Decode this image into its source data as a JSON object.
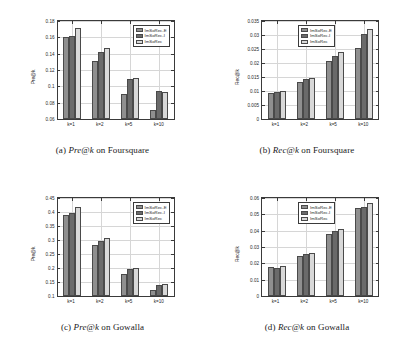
{
  "legend": {
    "position": "top-right",
    "entries": [
      "ImSoRec-E",
      "ImSoRec-I",
      "ImSoRec"
    ]
  },
  "colors": {
    "series_e": "#8f8f8f",
    "series_i": "#6a6a6a",
    "series_full": "#d8d8d8",
    "axis": "#3a3a3a",
    "grid": "#d6d6d6"
  },
  "chart_data": [
    {
      "id": "a",
      "type": "bar",
      "title": "(a) Pre@k on Foursquare",
      "caption_prefix": "(a)",
      "caption_metric": "Pre@k",
      "caption_suffix": "on Foursquare",
      "xlabel": "",
      "ylabel": "Pre@k",
      "categories": [
        "k=1",
        "k=2",
        "k=5",
        "k=10"
      ],
      "ylim": [
        0.06,
        0.18
      ],
      "yticks": [
        0.06,
        0.08,
        0.1,
        0.12,
        0.14,
        0.16,
        0.18
      ],
      "ytick_labels": [
        "0.06",
        "0.08",
        "0.1",
        "0.12",
        "0.14",
        "0.16",
        "0.18"
      ],
      "grid": true,
      "series": [
        {
          "name": "ImSoRec-E",
          "values": [
            0.1602,
            0.131,
            0.091,
            0.071
          ]
        },
        {
          "name": "ImSoRec-I",
          "values": [
            0.162,
            0.142,
            0.1088,
            0.0938
          ]
        },
        {
          "name": "ImSoRec",
          "values": [
            0.1718,
            0.1472,
            0.1102,
            0.0928
          ]
        }
      ]
    },
    {
      "id": "b",
      "type": "bar",
      "title": "(b) Rec@k on Foursquare",
      "caption_prefix": "(b)",
      "caption_metric": "Rec@k",
      "caption_suffix": "on Foursquare",
      "xlabel": "",
      "ylabel": "Rec@k",
      "categories": [
        "k=1",
        "k=2",
        "k=5",
        "k=10"
      ],
      "ylim": [
        0,
        0.035
      ],
      "yticks": [
        0,
        0.005,
        0.01,
        0.015,
        0.02,
        0.025,
        0.03,
        0.035
      ],
      "ytick_labels": [
        "0",
        "0.005",
        "0.01",
        "0.015",
        "0.02",
        "0.025",
        "0.03",
        "0.035"
      ],
      "grid": true,
      "series": [
        {
          "name": "ImSoRec-E",
          "values": [
            0.0093,
            0.0133,
            0.0206,
            0.0254
          ]
        },
        {
          "name": "ImSoRec-I",
          "values": [
            0.0096,
            0.0142,
            0.0225,
            0.0305
          ]
        },
        {
          "name": "ImSoRec",
          "values": [
            0.0101,
            0.0146,
            0.0238,
            0.0321
          ]
        }
      ]
    },
    {
      "id": "c",
      "type": "bar",
      "title": "(c) Pre@k on Gowalla",
      "caption_prefix": "(c)",
      "caption_metric": "Pre@k",
      "caption_suffix": "on Gowalla",
      "xlabel": "",
      "ylabel": "Pre@k",
      "categories": [
        "k=1",
        "k=2",
        "k=5",
        "k=10"
      ],
      "ylim": [
        0.1,
        0.45
      ],
      "yticks": [
        0.1,
        0.15,
        0.2,
        0.25,
        0.3,
        0.35,
        0.4,
        0.45
      ],
      "ytick_labels": [
        "0.1",
        "0.15",
        "0.2",
        "0.25",
        "0.3",
        "0.35",
        "0.4",
        "0.45"
      ],
      "grid": true,
      "series": [
        {
          "name": "ImSoRec-E",
          "values": [
            0.39,
            0.281,
            0.178,
            0.122
          ]
        },
        {
          "name": "ImSoRec-I",
          "values": [
            0.396,
            0.297,
            0.196,
            0.139
          ]
        },
        {
          "name": "ImSoRec",
          "values": [
            0.417,
            0.306,
            0.199,
            0.142
          ]
        }
      ]
    },
    {
      "id": "d",
      "type": "bar",
      "title": "(d) Rec@k on Gowalla",
      "caption_prefix": "(d)",
      "caption_metric": "Rec@k",
      "caption_suffix": "on Gowalla",
      "xlabel": "",
      "ylabel": "Rec@k",
      "categories": [
        "k=1",
        "k=2",
        "k=5",
        "k=10"
      ],
      "ylim": [
        0,
        0.06
      ],
      "yticks": [
        0,
        0.01,
        0.02,
        0.03,
        0.04,
        0.05,
        0.06
      ],
      "ytick_labels": [
        "0",
        "0.01",
        "0.02",
        "0.03",
        "0.04",
        "0.05",
        "0.06"
      ],
      "grid": true,
      "series": [
        {
          "name": "ImSoRec-E",
          "values": [
            0.0175,
            0.0246,
            0.0378,
            0.0538
          ]
        },
        {
          "name": "ImSoRec-I",
          "values": [
            0.0173,
            0.0255,
            0.04,
            0.0548
          ]
        },
        {
          "name": "ImSoRec",
          "values": [
            0.0181,
            0.0263,
            0.0413,
            0.057
          ]
        }
      ]
    }
  ]
}
